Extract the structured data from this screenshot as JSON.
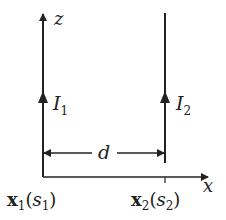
{
  "diagram": {
    "axes": {
      "z_label": "z",
      "x_label": "x"
    },
    "wires": [
      {
        "current_label": "I",
        "current_sub": "1",
        "position_label": "x",
        "position_sub": "1",
        "param": "s",
        "param_sub": "1"
      },
      {
        "current_label": "I",
        "current_sub": "2",
        "position_label": "x",
        "position_sub": "2",
        "param": "s",
        "param_sub": "2"
      }
    ],
    "separation_label": "d",
    "colors": {
      "line": "#222222",
      "background": "#ffffff"
    }
  }
}
